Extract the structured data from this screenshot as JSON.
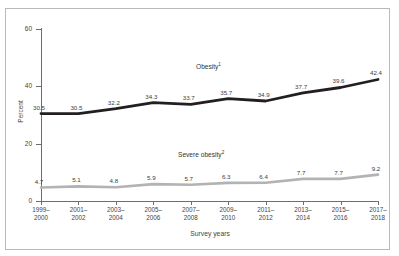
{
  "chart_data": {
    "type": "line",
    "title": "",
    "xlabel": "Survey years",
    "ylabel": "Percent",
    "ylim": [
      0,
      60
    ],
    "yticks": [
      0,
      20,
      40,
      60
    ],
    "grid": false,
    "legend_position": "inline-annotation",
    "categories": [
      "1999-2000",
      "2001-2002",
      "2003-2004",
      "2005-2006",
      "2007-2008",
      "2009-2010",
      "2011-2012",
      "2013-2014",
      "2015-2016",
      "2017-2018"
    ],
    "category_lines": [
      [
        "1999–",
        "2000"
      ],
      [
        "2001–",
        "2002"
      ],
      [
        "2003–",
        "2004"
      ],
      [
        "2005–",
        "2006"
      ],
      [
        "2007–",
        "2008"
      ],
      [
        "2009–",
        "2010"
      ],
      [
        "2011–",
        "2012"
      ],
      [
        "2013–",
        "2014"
      ],
      [
        "2015–",
        "2016"
      ],
      [
        "2017–",
        "2018"
      ]
    ],
    "series": [
      {
        "name": "Obesity",
        "footnote": "1",
        "color": "#231f20",
        "values": [
          30.5,
          30.5,
          32.2,
          34.3,
          33.7,
          35.7,
          34.9,
          37.7,
          39.6,
          42.4
        ],
        "value_labels": [
          "30.5",
          "30.5",
          "32.2",
          "34.3",
          "33.7",
          "35.7",
          "34.9",
          "37.7",
          "39.6",
          "42.4"
        ]
      },
      {
        "name": "Severe obesity",
        "footnote": "2",
        "color": "#b3b3b3",
        "values": [
          4.7,
          5.1,
          4.8,
          5.9,
          5.7,
          6.3,
          6.4,
          7.7,
          7.7,
          9.2
        ],
        "value_labels": [
          "4.7",
          "5.1",
          "4.8",
          "5.9",
          "5.7",
          "6.3",
          "6.4",
          "7.7",
          "7.7",
          "9.2"
        ]
      }
    ]
  },
  "axes": {
    "y_tick_labels": [
      "0",
      "20",
      "40",
      "60"
    ],
    "y_axis_title": "Percent",
    "x_axis_title": "Survey years"
  },
  "colors": {
    "obesity_line": "#231f20",
    "severe_obesity_line": "#b3b3b3",
    "axis": "#6e6e6e",
    "frame": "#b9b9b9",
    "background": "#ffffff"
  }
}
